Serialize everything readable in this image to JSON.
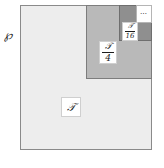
{
  "figure": {
    "type": "nested-self-similar-square-decomposition",
    "outer_label": "℘",
    "regions": [
      {
        "name": "T",
        "label_numerator": "𝒯",
        "label_denominator": "",
        "fill": "#ececec",
        "border": "#8a8a8a"
      },
      {
        "name": "T/4",
        "label_numerator": "𝒯",
        "label_denominator": "4",
        "fill": "#b9b9b9",
        "border": "#7d7d7d"
      },
      {
        "name": "T/16",
        "label_numerator": "𝒯",
        "label_denominator": "16",
        "fill": "#8f8f8f",
        "border": "#6e6e6e"
      }
    ],
    "continuation": {
      "glyph": "⋯",
      "meaning": "ellipsis-infinite-nesting",
      "fill": "#ffffff"
    },
    "colors": {
      "background": "#ffffff",
      "ink": "#1c1c1c",
      "tone_light": "#ececec",
      "tone_medium": "#b9b9b9",
      "tone_dark": "#8f8f8f",
      "outline": "#8a8a8a"
    }
  }
}
